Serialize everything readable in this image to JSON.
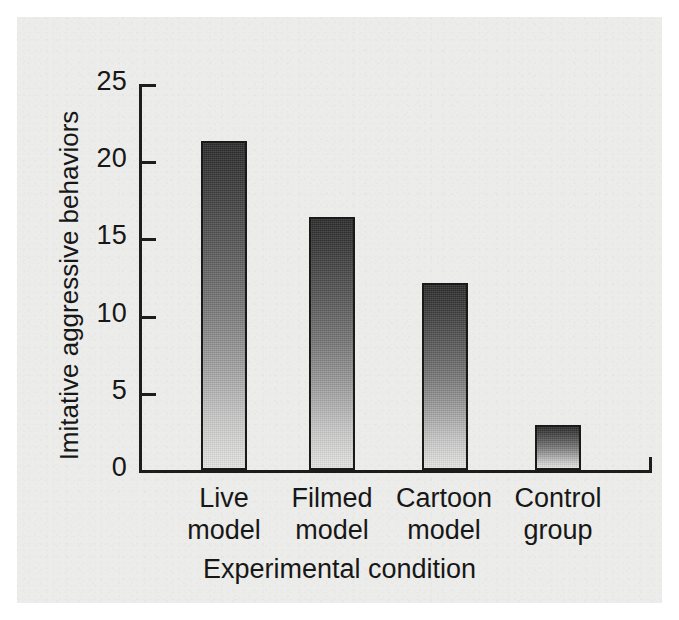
{
  "figure": {
    "background_color": "#ececea",
    "ink_color": "#1d1d1d"
  },
  "chart_data": {
    "type": "bar",
    "title": "",
    "subtitle": "",
    "xlabel": "Experimental condition",
    "ylabel": "Imitative aggressive behaviors",
    "categories": [
      "Live model",
      "Filmed model",
      "Cartoon model",
      "Control group"
    ],
    "category_lines": [
      [
        "Live",
        "model"
      ],
      [
        "Filmed",
        "model"
      ],
      [
        "Cartoon",
        "model"
      ],
      [
        "Control",
        "group"
      ]
    ],
    "values": [
      21.3,
      16.4,
      12.1,
      2.9
    ],
    "ylim": [
      0,
      25
    ],
    "ytick_labels": [
      "0",
      "5",
      "10",
      "15",
      "20",
      "25"
    ],
    "ytick_values": [
      0,
      5,
      10,
      15,
      20,
      25
    ],
    "grid": false,
    "legend": false,
    "legend_position": "none",
    "bar_fill": "vertical-gradient dark-to-light",
    "bar_edge_color": "#1a1a1a"
  },
  "axis": {
    "y_title": "Imitative aggressive behaviors",
    "x_title": "Experimental condition",
    "ticks": [
      {
        "label": "25",
        "value": 25
      },
      {
        "label": "20",
        "value": 20
      },
      {
        "label": "15",
        "value": 15
      },
      {
        "label": "10",
        "value": 10
      },
      {
        "label": "5",
        "value": 5
      },
      {
        "label": "0",
        "value": 0
      }
    ]
  },
  "bars": [
    {
      "label_line1": "Live",
      "label_line2": "model",
      "value": 21.3
    },
    {
      "label_line1": "Filmed",
      "label_line2": "model",
      "value": 16.4
    },
    {
      "label_line1": "Cartoon",
      "label_line2": "model",
      "value": 12.1
    },
    {
      "label_line1": "Control",
      "label_line2": "group",
      "value": 2.9
    }
  ]
}
